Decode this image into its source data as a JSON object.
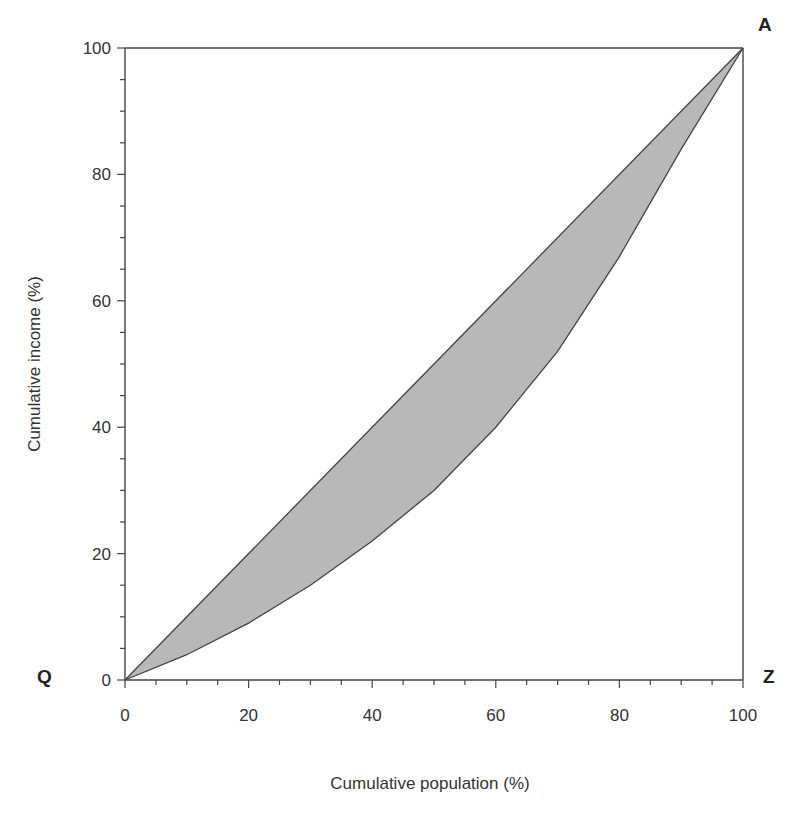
{
  "chart_data": {
    "type": "area",
    "title": "",
    "xlabel": "Cumulative population (%)",
    "ylabel": "Cumulative income (%)",
    "xlim": [
      0,
      100
    ],
    "ylim": [
      0,
      100
    ],
    "x_ticks": [
      0,
      20,
      40,
      60,
      80,
      100
    ],
    "y_ticks": [
      0,
      20,
      40,
      60,
      80,
      100
    ],
    "x_tick_labels": [
      "0",
      "20",
      "40",
      "60",
      "80",
      "100"
    ],
    "y_tick_labels": [
      "0",
      "20",
      "40",
      "60",
      "80",
      "100"
    ],
    "grid": false,
    "legend": null,
    "corner_labels": {
      "top_right": "A",
      "bottom_left": "Q",
      "bottom_right": "Z"
    },
    "series": [
      {
        "name": "Line of equality",
        "x": [
          0,
          100
        ],
        "y": [
          0,
          100
        ]
      },
      {
        "name": "Lorenz curve",
        "x": [
          0,
          10,
          20,
          30,
          40,
          50,
          60,
          70,
          80,
          90,
          100
        ],
        "y": [
          0,
          4,
          9,
          15,
          22,
          30,
          40,
          52,
          67,
          84,
          100
        ]
      }
    ],
    "shaded_region": "area between line of equality and Lorenz curve",
    "fill_color": "#b8b8b8",
    "line_color": "#444444"
  }
}
